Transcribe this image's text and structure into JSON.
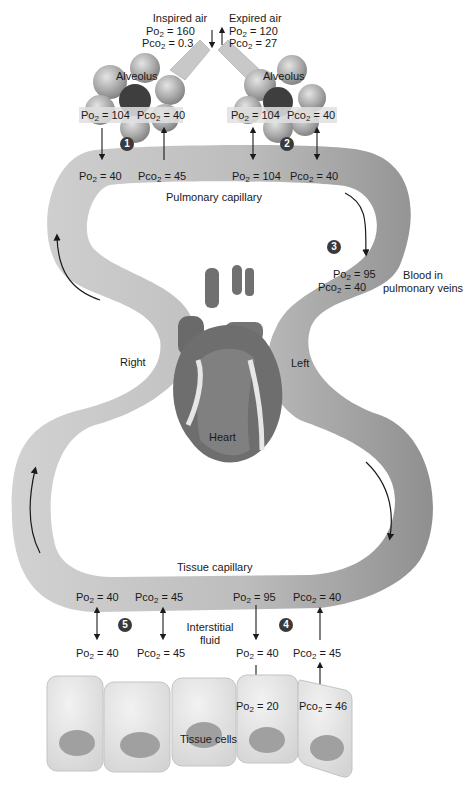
{
  "air": {
    "inspired": {
      "title": "Inspired air",
      "po2": "160",
      "pco2": "0.3"
    },
    "expired": {
      "title": "Expired air",
      "po2": "120",
      "pco2": "27"
    }
  },
  "alveoli": [
    {
      "label": "Alveolus",
      "po2": "104",
      "pco2": "40",
      "step": "1"
    },
    {
      "label": "Alveolus",
      "po2": "104",
      "pco2": "40",
      "step": "2"
    }
  ],
  "pulmonary_capillary": {
    "label": "Pulmonary capillary",
    "left": {
      "po2": "40",
      "pco2": "45"
    },
    "right": {
      "po2": "104",
      "pco2": "40"
    }
  },
  "pulmonary_veins": {
    "step": "3",
    "po2": "95",
    "pco2": "40",
    "label_line1": "Blood in",
    "label_line2": "pulmonary veins"
  },
  "heart": {
    "label": "Heart",
    "right_label": "Right",
    "left_label": "Left"
  },
  "tissue_capillary": {
    "label": "Tissue capillary",
    "left": {
      "po2": "40",
      "pco2": "45"
    },
    "right": {
      "po2": "95",
      "pco2": "40"
    }
  },
  "interstitial": {
    "label_line1": "Interstitial",
    "label_line2": "fluid",
    "step_left": "5",
    "step_right": "4",
    "left": {
      "po2": "40",
      "pco2": "45"
    },
    "right": {
      "po2": "40",
      "pco2": "45"
    }
  },
  "tissue_cells": {
    "label": "Tissue cells",
    "po2": "20",
    "pco2": "46"
  },
  "symbols": {
    "po2_prefix": "Po",
    "pco2_prefix": "Pco",
    "sub": "2",
    "eq": " = "
  },
  "colors": {
    "vessel_light": "#cfcfcf",
    "vessel_dark": "#9a9a9a",
    "heart": "#6e6e6e",
    "badge": "#3a3a3a",
    "cell": "#e6e6e6",
    "nucleus": "#9c9c9c"
  }
}
